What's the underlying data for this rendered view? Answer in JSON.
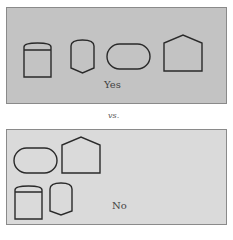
{
  "top_panel": {
    "label": "Yes"
  },
  "separator": {
    "label": "vs."
  },
  "bottom_panel": {
    "label": "No"
  },
  "shapes": [
    "cylinder",
    "shield",
    "stadium",
    "pentagon"
  ],
  "colors": {
    "top_fill": "#c3c3c3",
    "bottom_fill": "#dadada",
    "stroke": "#2a2a2a"
  }
}
